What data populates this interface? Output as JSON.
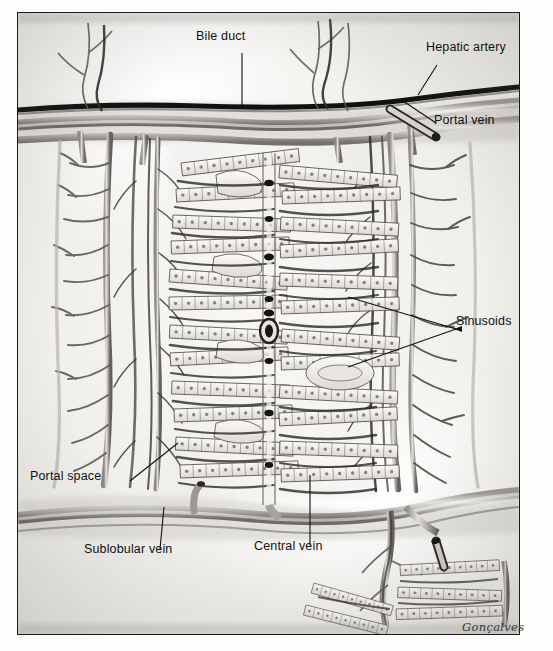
{
  "figure": {
    "signature": "Gonçalves",
    "frame_color": "#1b1b1b",
    "paper_color": "#f3f2ef",
    "ink_color": "#1a1a1a"
  },
  "labels": [
    {
      "id": "bile-duct",
      "text": "Bile duct",
      "x": 196,
      "y": 30,
      "leader": {
        "x": 224,
        "y": 44,
        "length": 52,
        "angle": 90
      }
    },
    {
      "id": "hepatic-artery",
      "text": "Hepatic artery",
      "x": 426,
      "y": 41,
      "leader": {
        "x": 415,
        "y": 55,
        "length": 34,
        "angle": 118
      }
    },
    {
      "id": "portal-vein",
      "text": "Portal vein",
      "x": 434,
      "y": 114,
      "leader": {
        "x": 430,
        "y": 112,
        "length": 46,
        "angle": 214
      }
    },
    {
      "id": "sinusoids",
      "text": "Sinusoids",
      "x": 456,
      "y": 315,
      "leader": {
        "x": 450,
        "y": 320,
        "length": 120,
        "angle": 196
      }
    },
    {
      "id": "portal-space",
      "text": "Portal space",
      "x": 30,
      "y": 470,
      "leader": {
        "x": 110,
        "y": 472,
        "length": 58,
        "angle": 328
      }
    },
    {
      "id": "sublobular-vein",
      "text": "Sublobular vein",
      "x": 84,
      "y": 543,
      "leader": {
        "x": 142,
        "y": 540,
        "length": 42,
        "angle": 272
      }
    },
    {
      "id": "central-vein",
      "text": "Central vein",
      "x": 254,
      "y": 540,
      "leader": {
        "x": 292,
        "y": 538,
        "length": 72,
        "angle": 270
      }
    }
  ],
  "anatomy": {
    "structures": [
      "portal triad band (upper)",
      "interlobular vessel trees (left and right)",
      "hepatic cell plates / cords",
      "sinusoids between hepatocyte plates",
      "central vein (vertical mid-channel)",
      "sublobular vein band (lower)",
      "adjacent lobule fragment (lower right)"
    ],
    "lobule": {
      "rows_left": 11,
      "rows_right": 11,
      "cells_per_plate": 9,
      "central_vein_x": 251,
      "lobule_top": 138,
      "lobule_bottom": 478
    }
  }
}
